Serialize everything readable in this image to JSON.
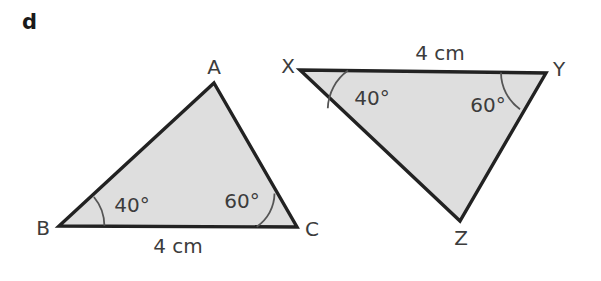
{
  "figure": {
    "part_label": "d",
    "background_color": "#ffffff",
    "shape_fill_color": "#dedede",
    "shape_stroke_color": "#222222",
    "arc_stroke_color": "#555555",
    "text_color": "#3c3c3c"
  },
  "triangles": [
    {
      "name": "triangle-abc",
      "vertices": [
        {
          "label": "A",
          "x": 214,
          "y": 83,
          "label_x": 214,
          "label_y": 74
        },
        {
          "label": "B",
          "x": 59,
          "y": 226,
          "label_x": 43,
          "label_y": 235
        },
        {
          "label": "C",
          "x": 297,
          "y": 227,
          "label_x": 312,
          "label_y": 236
        }
      ],
      "angles": [
        {
          "at": "B",
          "value": "40°",
          "label_x": 132,
          "label_y": 212
        },
        {
          "at": "C",
          "value": "60°",
          "label_x": 242,
          "label_y": 208
        }
      ],
      "sides": [
        {
          "from": "B",
          "to": "C",
          "value": "4 cm",
          "label_x": 178,
          "label_y": 253
        }
      ]
    },
    {
      "name": "triangle-xyz",
      "vertices": [
        {
          "label": "X",
          "x": 300,
          "y": 70,
          "label_x": 288,
          "label_y": 73
        },
        {
          "label": "Y",
          "x": 546,
          "y": 73,
          "label_x": 559,
          "label_y": 76
        },
        {
          "label": "Z",
          "x": 460,
          "y": 221,
          "label_x": 461,
          "label_y": 245
        }
      ],
      "angles": [
        {
          "at": "X",
          "value": "40°",
          "label_x": 372,
          "label_y": 105
        },
        {
          "at": "Y",
          "value": "60°",
          "label_x": 488,
          "label_y": 112
        }
      ],
      "sides": [
        {
          "from": "X",
          "to": "Y",
          "value": "4 cm",
          "label_x": 440,
          "label_y": 60
        }
      ]
    }
  ]
}
